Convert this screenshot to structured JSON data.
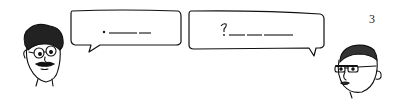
{
  "page": {
    "number": "3"
  },
  "bubbles": [
    {
      "speaker": "left-character",
      "text": ". ———— ——"
    },
    {
      "speaker": "right-character",
      "text": "?———————"
    }
  ],
  "characters": [
    {
      "name": "curly-haired-man-with-glasses-and-mustache",
      "position": "left"
    },
    {
      "name": "bald-man-with-glasses",
      "position": "right"
    }
  ]
}
